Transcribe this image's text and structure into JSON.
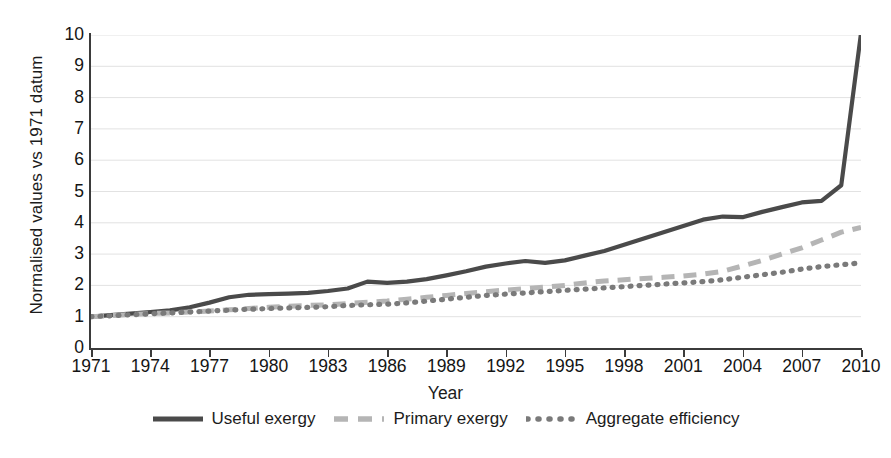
{
  "axes": {
    "ylabel": "Normalised values vs 1971 datum",
    "xlabel": "Year",
    "yticks": [
      "0",
      "1",
      "2",
      "3",
      "4",
      "5",
      "6",
      "7",
      "8",
      "9",
      "10"
    ],
    "xticks": [
      "1971",
      "1974",
      "1977",
      "1980",
      "1983",
      "1986",
      "1989",
      "1992",
      "1995",
      "1998",
      "2001",
      "2004",
      "2007",
      "2010"
    ]
  },
  "legend": {
    "items": [
      {
        "label": "Useful exergy",
        "style": "solid",
        "color": "#4a4a4a",
        "swatch": "legend-swatch-solid"
      },
      {
        "label": "Primary exergy",
        "style": "dashed",
        "color": "#b5b5b5",
        "swatch": "legend-swatch-dashed"
      },
      {
        "label": "Aggregate efficiency",
        "style": "dotted",
        "color": "#7a7a7a",
        "swatch": "legend-swatch-dotted"
      }
    ]
  },
  "colors": {
    "useful_exergy": "#4a4a4a",
    "primary_exergy": "#b5b5b5",
    "aggregate_efficiency": "#7a7a7a",
    "axis": "#3b3b3b",
    "gridline": "#e2e2e2",
    "background": "#ffffff"
  },
  "chart_data": {
    "type": "line",
    "title": "",
    "xlabel": "Year",
    "ylabel": "Normalised values vs 1971 datum",
    "xlim": [
      1971,
      2010
    ],
    "ylim": [
      0,
      10
    ],
    "grid": "horizontal",
    "legend_position": "bottom",
    "x": [
      1971,
      1972,
      1973,
      1974,
      1975,
      1976,
      1977,
      1978,
      1979,
      1980,
      1981,
      1982,
      1983,
      1984,
      1985,
      1986,
      1987,
      1988,
      1989,
      1990,
      1991,
      1992,
      1993,
      1994,
      1995,
      1996,
      1997,
      1998,
      1999,
      2000,
      2001,
      2002,
      2003,
      2004,
      2005,
      2006,
      2007,
      2008,
      2009,
      2010
    ],
    "series": [
      {
        "name": "Useful exergy",
        "style": "solid",
        "color": "#4a4a4a",
        "values": [
          1.0,
          1.05,
          1.1,
          1.15,
          1.2,
          1.3,
          1.45,
          1.62,
          1.7,
          1.72,
          1.74,
          1.76,
          1.82,
          1.9,
          2.12,
          2.08,
          2.12,
          2.2,
          2.32,
          2.45,
          2.6,
          2.7,
          2.78,
          2.72,
          2.8,
          2.95,
          3.1,
          3.3,
          3.5,
          3.7,
          3.9,
          4.1,
          4.2,
          4.18,
          4.35,
          4.5,
          4.65,
          4.7,
          5.2,
          10.05
        ]
      },
      {
        "name": "Primary exergy",
        "style": "dashed",
        "color": "#b5b5b5",
        "values": [
          1.0,
          1.03,
          1.07,
          1.1,
          1.12,
          1.15,
          1.18,
          1.22,
          1.26,
          1.3,
          1.33,
          1.36,
          1.38,
          1.42,
          1.46,
          1.5,
          1.56,
          1.62,
          1.68,
          1.74,
          1.8,
          1.85,
          1.9,
          1.95,
          2.0,
          2.08,
          2.14,
          2.18,
          2.22,
          2.26,
          2.3,
          2.36,
          2.45,
          2.62,
          2.8,
          3.0,
          3.2,
          3.45,
          3.7,
          3.85
        ]
      },
      {
        "name": "Aggregate efficiency",
        "style": "dotted",
        "color": "#7a7a7a",
        "values": [
          1.0,
          1.03,
          1.06,
          1.09,
          1.12,
          1.15,
          1.18,
          1.21,
          1.24,
          1.26,
          1.28,
          1.3,
          1.32,
          1.36,
          1.38,
          1.4,
          1.44,
          1.5,
          1.56,
          1.62,
          1.68,
          1.72,
          1.76,
          1.8,
          1.84,
          1.88,
          1.92,
          1.96,
          2.0,
          2.04,
          2.08,
          2.12,
          2.18,
          2.26,
          2.34,
          2.42,
          2.52,
          2.6,
          2.66,
          2.72
        ]
      }
    ]
  }
}
